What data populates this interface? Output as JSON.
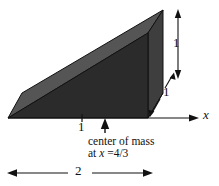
{
  "figure": {
    "type": "technical-diagram",
    "colors": {
      "background": "#ffffff",
      "top_face": "#555555",
      "front_face": "#2b2b2b",
      "end_face": "#3a3a3a",
      "outline": "#111111",
      "annotation": "#111111"
    },
    "solid": {
      "description": "triangular wedge / prism drawn in oblique projection",
      "vertices_px": {
        "front_bottom_left": [
          8,
          118
        ],
        "front_bottom_right": [
          148,
          118
        ],
        "front_top_right": [
          148,
          33
        ],
        "back_bottom_left": [
          22,
          93
        ],
        "back_bottom_right": [
          163,
          93
        ],
        "back_top_right": [
          163,
          10
        ]
      }
    },
    "axis": {
      "label": "x",
      "baseline_y": 118,
      "start_x": 8,
      "end_x": 200
    },
    "annotations": {
      "height_label": "1",
      "depth_label": "1",
      "tick_label": "1",
      "width_label": "2",
      "com_line1": "center of mass",
      "com_line2_prefix": "at ",
      "com_line2_var": "x",
      "com_line2_value": " =4/3",
      "com_arrow_x": 105,
      "tick_x": 82
    }
  }
}
